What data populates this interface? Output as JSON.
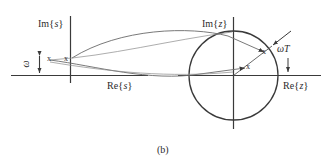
{
  "figure": {
    "caption": "(b)",
    "planes": [
      {
        "id": "s-plane",
        "imag_axis_label": "Im",
        "imag_axis_var": "s",
        "real_axis_label": "Re",
        "real_axis_var": "s",
        "brace_open": "{",
        "brace_close": "}",
        "markers": [
          {
            "glyph": "x",
            "name": "pole-marker-1"
          },
          {
            "glyph": "x",
            "name": "pole-marker-2"
          }
        ],
        "spacing_label": "ω"
      },
      {
        "id": "z-plane",
        "imag_axis_label": "Im",
        "imag_axis_var": "z",
        "real_axis_label": "Re",
        "real_axis_var": "z",
        "brace_open": "{",
        "brace_close": "}",
        "markers": [
          {
            "glyph": "x",
            "name": "mapped-pole-marker-1"
          },
          {
            "glyph": "x",
            "name": "mapped-pole-marker-2"
          }
        ],
        "angle_label_omega": "ω",
        "angle_label_t": "T"
      }
    ],
    "colors": {
      "ink": "#2b2b2b",
      "curve": "#4a4a4a",
      "background": "#ffffff"
    }
  }
}
